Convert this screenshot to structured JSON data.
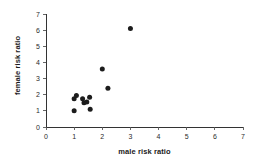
{
  "chart_data": {
    "type": "scatter",
    "title": "",
    "xlabel": "male risk ratio",
    "ylabel": "female risk ratio",
    "xlim": [
      0,
      7
    ],
    "ylim": [
      0,
      7
    ],
    "xticks": [
      0,
      1,
      2,
      3,
      4,
      5,
      6,
      7
    ],
    "yticks": [
      0,
      1,
      2,
      3,
      4,
      5,
      6,
      7
    ],
    "xtick_labels": [
      "0",
      "1",
      "2",
      "3",
      "4",
      "5",
      "6",
      "7"
    ],
    "ytick_labels": [
      "0",
      "1",
      "2",
      "3",
      "4",
      "5",
      "6",
      "7"
    ],
    "grid": false,
    "legend": null,
    "marker": "filled-circle",
    "marker_color": "#1c1c1c",
    "axis_color": "#333333",
    "points": [
      {
        "x": 3.0,
        "y": 6.1
      },
      {
        "x": 2.0,
        "y": 3.6
      },
      {
        "x": 2.2,
        "y": 2.4
      },
      {
        "x": 1.0,
        "y": 1.75
      },
      {
        "x": 1.08,
        "y": 1.95
      },
      {
        "x": 1.3,
        "y": 1.75
      },
      {
        "x": 1.35,
        "y": 1.5
      },
      {
        "x": 1.45,
        "y": 1.55
      },
      {
        "x": 1.55,
        "y": 1.85
      },
      {
        "x": 1.57,
        "y": 1.1
      },
      {
        "x": 1.0,
        "y": 1.0
      }
    ],
    "series_name": "risk ratio pairs"
  },
  "axes": {
    "x_label": "male risk ratio",
    "y_label": "female risk ratio"
  }
}
